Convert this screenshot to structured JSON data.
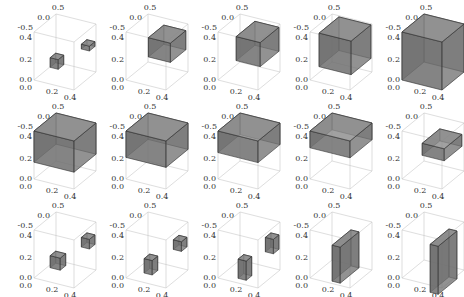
{
  "figure": {
    "rows": 3,
    "cols": 5,
    "axis_ticks": {
      "back_axis": [
        "0.5",
        "0.0",
        "-0.5"
      ],
      "vertical_axis": [
        "0.4",
        "0.2",
        "0.0"
      ],
      "front_axis": [
        "0.0",
        "0.2",
        "0.4"
      ]
    },
    "colors": {
      "box_frame": "#c8c8c8",
      "solid_face": "#6e6e6e",
      "solid_top": "#8a8a8a",
      "solid_edge": "#333333",
      "tick_text": "#333333"
    },
    "panels": [
      {
        "row": 0,
        "col": 0,
        "shape": "small-blocks"
      },
      {
        "row": 0,
        "col": 1,
        "shape": "arch-slab-thin"
      },
      {
        "row": 0,
        "col": 2,
        "shape": "arch-slab-medium"
      },
      {
        "row": 0,
        "col": 3,
        "shape": "arch-slab-large"
      },
      {
        "row": 0,
        "col": 4,
        "shape": "full-cube"
      },
      {
        "row": 1,
        "col": 0,
        "shape": "top-slab-thick"
      },
      {
        "row": 1,
        "col": 1,
        "shape": "top-slab-medium"
      },
      {
        "row": 1,
        "col": 2,
        "shape": "top-slab-thin"
      },
      {
        "row": 1,
        "col": 3,
        "shape": "top-slab-thinner"
      },
      {
        "row": 1,
        "col": 4,
        "shape": "corner-slab"
      },
      {
        "row": 2,
        "col": 0,
        "shape": "two-small-blocks"
      },
      {
        "row": 2,
        "col": 1,
        "shape": "two-small-blocks-b"
      },
      {
        "row": 2,
        "col": 2,
        "shape": "two-pillars"
      },
      {
        "row": 2,
        "col": 3,
        "shape": "tall-arch"
      },
      {
        "row": 2,
        "col": 4,
        "shape": "tall-arch-full"
      }
    ]
  }
}
